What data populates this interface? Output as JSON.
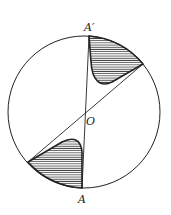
{
  "diagram": {
    "labels": {
      "top_point": "A′",
      "center": "O",
      "bottom_point": "A"
    },
    "colors": {
      "stroke": "#222222",
      "background": "#ffffff",
      "hatch": "#333333"
    },
    "circle": {
      "cx": 84,
      "cy": 112,
      "r": 76
    }
  }
}
